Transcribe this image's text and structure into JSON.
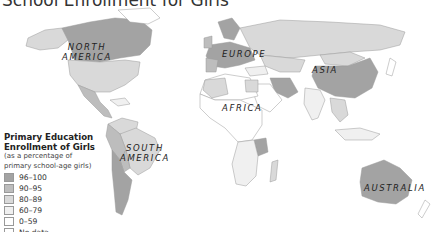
{
  "title": "School Enrollment for Girls",
  "regions": [
    {
      "label_line1": "NORTH",
      "label_line2": "AMERICA"
    },
    {
      "label_line1": "EUROPE"
    },
    {
      "label_line1": "ASIA"
    },
    {
      "label_line1": "AFRICA"
    },
    {
      "label_line1": "SOUTH",
      "label_line2": "AMERICA"
    },
    {
      "label_line1": "AUSTRALIA"
    }
  ],
  "legend": {
    "title_line1": "Primary Education",
    "title_line2": "Enrollment of Girls",
    "subtitle_line1": "(as a percentage of",
    "subtitle_line2": "primary school-age girls)",
    "items": [
      {
        "label": "96–100",
        "color": "#a3a3a3"
      },
      {
        "label": "90–95",
        "color": "#bdbdbd"
      },
      {
        "label": "80–89",
        "color": "#d9d9d9"
      },
      {
        "label": "60–79",
        "color": "#f0f0f0"
      },
      {
        "label": "0–59",
        "color": "#ffffff"
      },
      {
        "label": "No data",
        "color": "#ffffff"
      }
    ]
  },
  "colors": {
    "c96": "#a3a3a3",
    "c90": "#bdbdbd",
    "c80": "#d9d9d9",
    "c60": "#f0f0f0",
    "c0": "#ffffff",
    "border": "#9a9a9a"
  }
}
